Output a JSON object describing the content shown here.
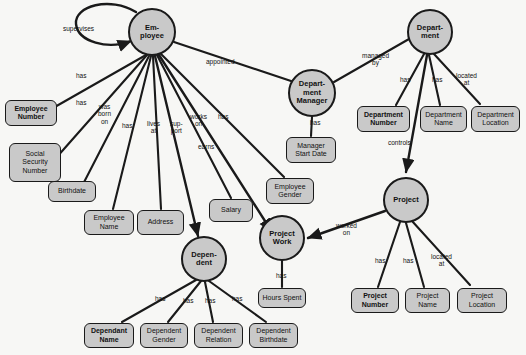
{
  "diagram": {
    "type": "entity-relationship-diagram",
    "colors": {
      "node_fill": "#c9c9c9",
      "node_stroke": "#1a1a1a",
      "background": "#f7f7f5",
      "text": "#111111"
    },
    "entities": [
      {
        "id": "employee",
        "label": "Em-\nployee",
        "cx": 152,
        "cy": 32,
        "r": 24
      },
      {
        "id": "department_manager",
        "label": "Depart-\nment\nManager",
        "cx": 312,
        "cy": 93,
        "r": 24
      },
      {
        "id": "department",
        "label": "Depart-\nment",
        "cx": 430,
        "cy": 32,
        "r": 23
      },
      {
        "id": "project",
        "label": "Project",
        "cx": 406,
        "cy": 200,
        "r": 23
      },
      {
        "id": "project_work",
        "label": "Project\nWork",
        "cx": 282,
        "cy": 238,
        "r": 23
      },
      {
        "id": "dependent",
        "label": "Depen-\ndent",
        "cx": 204,
        "cy": 259,
        "r": 23
      }
    ],
    "attributes": [
      {
        "id": "employee_number",
        "label": "Employee\nNumber",
        "x": 5,
        "y": 100,
        "w": 52,
        "h": 26,
        "key": true
      },
      {
        "id": "social_security",
        "label": "Social\nSecurity\nNumber",
        "x": 9,
        "y": 143,
        "w": 52,
        "h": 39,
        "key": false
      },
      {
        "id": "birthdate",
        "label": "Birthdate",
        "x": 48,
        "y": 181,
        "w": 48,
        "h": 21,
        "key": false
      },
      {
        "id": "employee_name",
        "label": "Employee\nName",
        "x": 84,
        "y": 210,
        "w": 50,
        "h": 25,
        "key": false
      },
      {
        "id": "address",
        "label": "Address",
        "x": 137,
        "y": 210,
        "w": 47,
        "h": 25,
        "key": false
      },
      {
        "id": "salary",
        "label": "Salary",
        "x": 209,
        "y": 199,
        "w": 44,
        "h": 23,
        "key": false
      },
      {
        "id": "employee_gender",
        "label": "Employee\nGender",
        "x": 266,
        "y": 178,
        "w": 48,
        "h": 26,
        "key": false
      },
      {
        "id": "hours_spent",
        "label": "Hours Spent",
        "x": 258,
        "y": 288,
        "w": 48,
        "h": 20,
        "key": false
      },
      {
        "id": "dependant_name",
        "label": "Dependant\nName",
        "x": 84,
        "y": 323,
        "w": 50,
        "h": 25,
        "key": true
      },
      {
        "id": "dependent_gender",
        "label": "Dependent\nGender",
        "x": 140,
        "y": 323,
        "w": 48,
        "h": 25,
        "key": false
      },
      {
        "id": "dependent_relation",
        "label": "Dependent\nRelation",
        "x": 194,
        "y": 323,
        "w": 49,
        "h": 25,
        "key": false
      },
      {
        "id": "dependent_birthdate",
        "label": "Dependent\nBirthdate",
        "x": 249,
        "y": 323,
        "w": 49,
        "h": 25,
        "key": false
      },
      {
        "id": "manager_start_date",
        "label": "Manager\nStart Date",
        "x": 286,
        "y": 137,
        "w": 50,
        "h": 26,
        "key": false
      },
      {
        "id": "department_number",
        "label": "Department\nNumber",
        "x": 357,
        "y": 106,
        "w": 53,
        "h": 26,
        "key": true
      },
      {
        "id": "department_name",
        "label": "Department\nName",
        "x": 420,
        "y": 106,
        "w": 47,
        "h": 26,
        "key": false
      },
      {
        "id": "department_location",
        "label": "Department\nLocation",
        "x": 471,
        "y": 106,
        "w": 49,
        "h": 26,
        "key": false
      },
      {
        "id": "project_number",
        "label": "Project\nNumber",
        "x": 351,
        "y": 288,
        "w": 48,
        "h": 25,
        "key": true
      },
      {
        "id": "project_name",
        "label": "Project\nName",
        "x": 405,
        "y": 288,
        "w": 45,
        "h": 25,
        "key": false
      },
      {
        "id": "project_location",
        "label": "Project\nLocation",
        "x": 457,
        "y": 288,
        "w": 50,
        "h": 25,
        "key": false
      }
    ],
    "relationship_labels": [
      {
        "id": "supervises",
        "text": "supervises",
        "x": 63,
        "y": 25
      },
      {
        "id": "has_empnum",
        "text": "has",
        "x": 76,
        "y": 72
      },
      {
        "id": "has_ssn",
        "text": "has",
        "x": 76,
        "y": 99
      },
      {
        "id": "was_born_on",
        "text": "was\nborn\non",
        "x": 98,
        "y": 103
      },
      {
        "id": "has_empname",
        "text": "has",
        "x": 122,
        "y": 122
      },
      {
        "id": "lives_at",
        "text": "lives\nat",
        "x": 147,
        "y": 120
      },
      {
        "id": "support",
        "text": "sup-\nport",
        "x": 170,
        "y": 120
      },
      {
        "id": "works_on",
        "text": "works\non",
        "x": 190,
        "y": 113
      },
      {
        "id": "has_gender",
        "text": "has",
        "x": 218,
        "y": 113
      },
      {
        "id": "earns",
        "text": "earns",
        "x": 198,
        "y": 143
      },
      {
        "id": "appointed",
        "text": "appointed",
        "x": 206,
        "y": 58
      },
      {
        "id": "managed_by",
        "text": "managed\nby",
        "x": 362,
        "y": 52
      },
      {
        "id": "has_deptnum",
        "text": "has",
        "x": 400,
        "y": 76
      },
      {
        "id": "has_deptname",
        "text": "has",
        "x": 432,
        "y": 76
      },
      {
        "id": "located_at_d",
        "text": "located\nat",
        "x": 456,
        "y": 72
      },
      {
        "id": "has_mgrstart",
        "text": "has",
        "x": 310,
        "y": 119
      },
      {
        "id": "controls",
        "text": "controls",
        "x": 388,
        "y": 139
      },
      {
        "id": "worked_on",
        "text": "worked\non",
        "x": 336,
        "y": 222
      },
      {
        "id": "has_projnum",
        "text": "has",
        "x": 375,
        "y": 257
      },
      {
        "id": "has_projname",
        "text": "has",
        "x": 403,
        "y": 257
      },
      {
        "id": "located_at_p",
        "text": "located\nat",
        "x": 431,
        "y": 253
      },
      {
        "id": "has_hours",
        "text": "has",
        "x": 276,
        "y": 272
      },
      {
        "id": "has_depname",
        "text": "has",
        "x": 155,
        "y": 295
      },
      {
        "id": "has_depgen",
        "text": "has",
        "x": 183,
        "y": 297
      },
      {
        "id": "has_deprel",
        "text": "has",
        "x": 205,
        "y": 297
      },
      {
        "id": "has_depbirth",
        "text": "has",
        "x": 232,
        "y": 295
      }
    ]
  }
}
